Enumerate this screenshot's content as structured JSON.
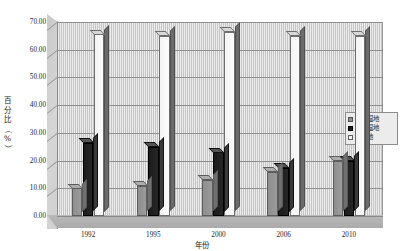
{
  "chart_data": {
    "type": "bar",
    "title": "",
    "xlabel": "年份",
    "ylabel": "百分比（%）",
    "ylabel_chars": [
      "百",
      "分",
      "比",
      "（",
      "%",
      "）"
    ],
    "categories": [
      "1992",
      "1995",
      "2000",
      "2006",
      "2010"
    ],
    "series": [
      {
        "name": "人工湿地",
        "color": "#8e8e8e",
        "key": "gray",
        "values": [
          10.0,
          11.0,
          13.0,
          16.0,
          20.0
        ]
      },
      {
        "name": "天然湿地",
        "color": "#1b1b1b",
        "key": "black",
        "values": [
          26.5,
          25.0,
          23.0,
          17.5,
          20.0
        ]
      },
      {
        "name": "非湿地",
        "color": "#fbfbfb",
        "key": "white",
        "values": [
          65.5,
          65.0,
          66.5,
          65.0,
          65.0
        ]
      }
    ],
    "yticks": [
      "0.00",
      "10.00",
      "20.00",
      "30.00",
      "40.00",
      "50.00",
      "60.00",
      "70.00"
    ],
    "ytick_values": [
      0,
      10,
      20,
      30,
      40,
      50,
      60,
      70
    ],
    "ylim": [
      0,
      70
    ],
    "grid": true,
    "legend_position": "right",
    "style": "3d-clustered-column"
  },
  "legend": {
    "items": [
      {
        "label": "人工湿地",
        "key": "gray"
      },
      {
        "label": "天然湿地",
        "key": "black"
      },
      {
        "label": "非湿地",
        "key": "white"
      }
    ]
  }
}
